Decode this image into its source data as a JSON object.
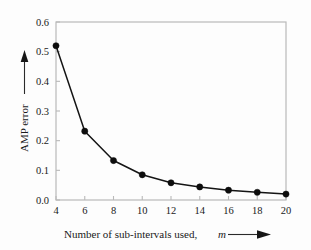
{
  "figure": {
    "background_color": "#fdfdfd",
    "axis_color": "#b9b9b9",
    "line_color": "#141414",
    "marker_color": "#0d0d0d"
  },
  "axis_labels": {
    "y_title": "AMP error",
    "y_arrow": "up-arrow",
    "x_title_main": "Number of sub-intervals used,",
    "x_title_symbol": "m",
    "x_arrow": "right-arrow"
  },
  "chart_data": {
    "type": "line",
    "title": "",
    "subtitle": "",
    "xlabel": "Number of sub-intervals used, m",
    "ylabel": "AMP error",
    "x": [
      4,
      6,
      8,
      10,
      12,
      14,
      16,
      18,
      20
    ],
    "values": [
      0.52,
      0.232,
      0.133,
      0.085,
      0.058,
      0.044,
      0.033,
      0.026,
      0.02
    ],
    "series": [
      {
        "name": "AMP error",
        "values": [
          0.52,
          0.232,
          0.133,
          0.085,
          0.058,
          0.044,
          0.033,
          0.026,
          0.02
        ]
      }
    ],
    "xlim": [
      4,
      20
    ],
    "ylim": [
      0.0,
      0.6
    ],
    "xticks": [
      4,
      6,
      8,
      10,
      12,
      14,
      16,
      18,
      20
    ],
    "xtick_labels": [
      "4",
      "6",
      "8",
      "10",
      "12",
      "14",
      "16",
      "18",
      "20"
    ],
    "yticks": [
      0.0,
      0.1,
      0.2,
      0.3,
      0.4,
      0.5,
      0.6
    ],
    "ytick_labels": [
      "0.0",
      "0.1",
      "0.2",
      "0.3",
      "0.4",
      "0.5",
      "0.6"
    ],
    "grid": false,
    "legend": false,
    "legend_position": "none",
    "marker": "filled-circle",
    "annotations": []
  }
}
